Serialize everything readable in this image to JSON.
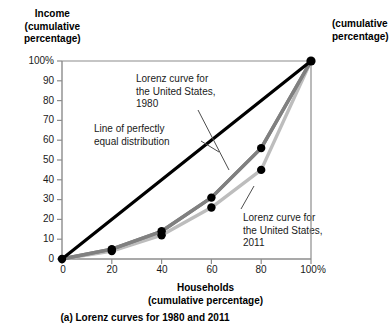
{
  "figure": {
    "caption": "(a) Lorenz curves for 1980 and 2011",
    "clipped_neighbor_label_line1": "(cumulative",
    "clipped_neighbor_label_line2": "percentage)"
  },
  "axes": {
    "y_title_line1": "Income",
    "y_title_line2": "(cumulative",
    "y_title_line3": "percentage)",
    "x_title_line1": "Households",
    "x_title_line2": "(cumulative percentage)"
  },
  "annotations": {
    "equality_line_1": "Line of perfectly",
    "equality_line_2": "equal distribution",
    "lorenz1980_line1": "Lorenz curve for",
    "lorenz1980_line2": "the United States,",
    "lorenz1980_line3": "1980",
    "lorenz2011_line1": "Lorenz curve for",
    "lorenz2011_line2": "the United States,",
    "lorenz2011_line3": "2011"
  },
  "colors": {
    "equality": "#000000",
    "lorenz_1980": "#808080",
    "lorenz_2011": "#bdbdbd",
    "marker": "#000000",
    "axis": "#8c8c8c",
    "leader": "#4d4d4d"
  },
  "chart_data": {
    "type": "line",
    "title": "(a) Lorenz curves for 1980 and 2011",
    "xlabel": "Households (cumulative percentage)",
    "ylabel": "Income (cumulative percentage)",
    "xlim": [
      0,
      100
    ],
    "ylim": [
      0,
      100
    ],
    "grid": false,
    "legend": "inline annotations",
    "x_ticks": [
      0,
      20,
      40,
      60,
      80,
      100
    ],
    "x_tick_labels": [
      "0",
      "20",
      "40",
      "60",
      "80",
      "100%"
    ],
    "y_ticks": [
      0,
      10,
      20,
      30,
      40,
      50,
      60,
      70,
      80,
      90,
      100
    ],
    "y_tick_labels": [
      "0",
      "10",
      "20",
      "30",
      "40",
      "50",
      "60",
      "70",
      "80",
      "90",
      "100%"
    ],
    "x": [
      0,
      20,
      40,
      60,
      80,
      100
    ],
    "series": [
      {
        "name": "Line of perfectly equal distribution",
        "values": [
          0,
          20,
          40,
          60,
          80,
          100
        ],
        "color": "#000000",
        "markers": false
      },
      {
        "name": "Lorenz curve for the United States, 1980",
        "values": [
          0,
          5,
          14,
          31,
          56,
          100
        ],
        "color": "#808080",
        "markers": true
      },
      {
        "name": "Lorenz curve for the United States, 2011",
        "values": [
          0,
          4,
          12,
          26,
          45,
          100
        ],
        "color": "#bdbdbd",
        "markers": true
      }
    ]
  }
}
